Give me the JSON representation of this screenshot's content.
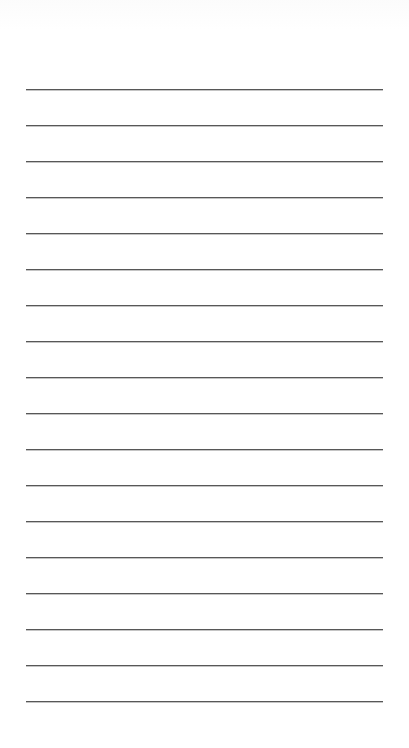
{
  "page": {
    "type": "lined-paper",
    "background_color": "#ffffff",
    "line_color": "#575757",
    "line_count": 18,
    "line_left": 26,
    "line_right": 383,
    "line_spacing": 36,
    "lines": [
      {
        "y": 89
      },
      {
        "y": 125
      },
      {
        "y": 161
      },
      {
        "y": 197
      },
      {
        "y": 233
      },
      {
        "y": 269
      },
      {
        "y": 305
      },
      {
        "y": 341
      },
      {
        "y": 377
      },
      {
        "y": 413
      },
      {
        "y": 449
      },
      {
        "y": 485
      },
      {
        "y": 521
      },
      {
        "y": 557
      },
      {
        "y": 593
      },
      {
        "y": 629
      },
      {
        "y": 665
      },
      {
        "y": 701
      }
    ]
  }
}
